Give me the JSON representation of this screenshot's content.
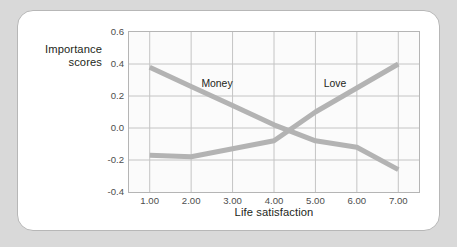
{
  "figure": {
    "background_color": "#d9d9d9",
    "card_color": "#ffffff",
    "card_border_color": "#b7b7b7"
  },
  "chart_data": {
    "type": "line",
    "title": "",
    "xlabel": "Life satisfaction",
    "ylabel": "Importance\nscores",
    "x": [
      1,
      2,
      3,
      4,
      5,
      6,
      7
    ],
    "xtick_labels": [
      "1.00",
      "2.00",
      "3.00",
      "4.00",
      "5.00",
      "6.00",
      "7.00"
    ],
    "ytick_labels": [
      "0.6",
      "0.4",
      "0.2",
      "0.0",
      "-0.2",
      "-0.4"
    ],
    "ytick_values": [
      0.6,
      0.4,
      0.2,
      0.0,
      -0.2,
      -0.4
    ],
    "xlim": [
      0.5,
      7.5
    ],
    "ylim": [
      -0.4,
      0.6
    ],
    "grid": true,
    "legend": "inline-annotations",
    "line_color": "#b3b3b3",
    "line_width": 5,
    "series": [
      {
        "name": "Money",
        "values": [
          0.38,
          0.26,
          0.14,
          0.02,
          -0.08,
          -0.12,
          -0.26
        ],
        "label_x": 2.6,
        "label_y": 0.29
      },
      {
        "name": "Love",
        "values": [
          -0.17,
          -0.18,
          -0.13,
          -0.08,
          0.1,
          0.25,
          0.4
        ],
        "label_x": 5.45,
        "label_y": 0.29
      }
    ]
  }
}
